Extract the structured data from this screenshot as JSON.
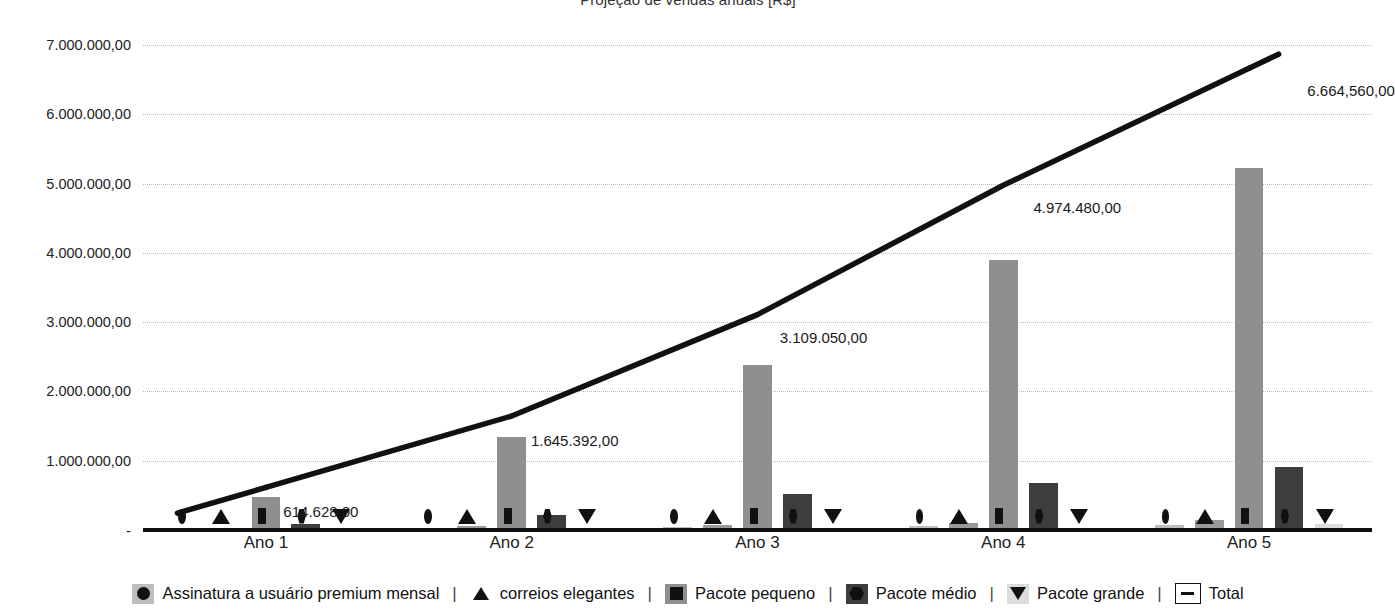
{
  "chart_data": {
    "type": "bar",
    "title": "Projeção de vendas anuais [R$]",
    "xlabel": "",
    "ylabel": "",
    "categories": [
      "Ano 1",
      "Ano 2",
      "Ano 3",
      "Ano 4",
      "Ano 5"
    ],
    "ylim": [
      0,
      7000000
    ],
    "grid": true,
    "legend_position": "bottom",
    "ytick_labels": [
      "7.000.000,00",
      "6.000.000,00",
      "5.000.000,00",
      "4.000.000,00",
      "3.000.000,00",
      "2.000.000,00",
      "1.000.000,00",
      "-"
    ],
    "ytick_values": [
      7000000,
      6000000,
      5000000,
      4000000,
      3000000,
      2000000,
      1000000,
      0
    ],
    "series": [
      {
        "name": "Assinatura a usuário premium mensal",
        "marker": "circle",
        "color": "#bdbdbd",
        "values": [
          21000,
          34000,
          48000,
          62000,
          76000
        ]
      },
      {
        "name": "correios elegantes",
        "marker": "triangle-up",
        "color": "#9a9a9a",
        "values": [
          32000,
          52000,
          76000,
          104000,
          138000
        ]
      },
      {
        "name": "Pacote pequeno",
        "marker": "square",
        "color": "#8f8f8f",
        "values": [
          470000,
          1340000,
          2380000,
          3890000,
          5220000
        ]
      },
      {
        "name": "Pacote médio",
        "marker": "hexagon",
        "color": "#3d3d3d",
        "values": [
          92000,
          220000,
          520000,
          680000,
          910000
        ]
      },
      {
        "name": "Pacote grande",
        "marker": "triangle-down",
        "color": "#dcdcdc",
        "values": [
          0,
          0,
          0,
          0,
          82000
        ]
      }
    ],
    "line_series": {
      "name": "Total",
      "color": "#111111",
      "values": [
        614628,
        1645392,
        3109050,
        4974480,
        6664560
      ],
      "labels": [
        "614.628,00",
        "1.645.392,00",
        "3.109.050,00",
        "4.974.480,00",
        "6.664,560,00"
      ]
    }
  },
  "legend": {
    "items": [
      {
        "label": "Assinatura a usuário premium mensal",
        "marker": "circle-icon",
        "swatch": "sw-assinatura"
      },
      {
        "label": "correios elegantes",
        "marker": "triangle-up-icon",
        "swatch": "sw-correios"
      },
      {
        "label": "Pacote pequeno",
        "marker": "square-icon",
        "swatch": "sw-pequeno"
      },
      {
        "label": "Pacote médio",
        "marker": "hexagon-icon",
        "swatch": "sw-medio"
      },
      {
        "label": "Pacote grande",
        "marker": "triangle-down-icon",
        "swatch": "sw-grande"
      },
      {
        "label": "Total",
        "marker": "dash-icon",
        "swatch": "sw-total"
      }
    ],
    "separator": "|"
  },
  "colors": {
    "assinatura": "#bdbdbd",
    "correios": "#9a9a9a",
    "pequeno": "#8f8f8f",
    "medio": "#3d3d3d",
    "grande": "#dcdcdc",
    "total_line": "#111111",
    "gridline": "#b9b9b9",
    "axis": "#111111",
    "text": "#1a1a1a",
    "background": "#ffffff"
  }
}
